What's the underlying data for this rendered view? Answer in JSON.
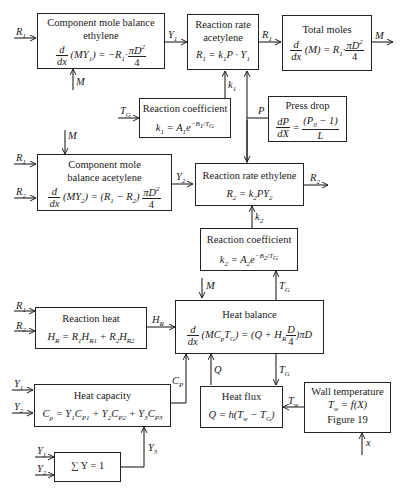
{
  "blocks": {
    "mole_ethylene": {
      "title_1": "Component mole balance",
      "title_2": "ethylene",
      "equation": "d/dx (M Y1) = −R1·πD²/4"
    },
    "rate_acetylene": {
      "title_1": "Reaction rate",
      "title_2": "acetylene",
      "equation": "R1 = k1P · Y1"
    },
    "total_moles": {
      "title": "Total moles",
      "equation": "d/dx (M) = R1·πD²/4"
    },
    "coef1": {
      "title": "Reaction coefficient",
      "equation": "k1 = A1 e^(−B1/TG)"
    },
    "press_drop": {
      "title": "Press drop",
      "equation": "dP/dX = (P0 − 1)/L"
    },
    "mole_acetylene": {
      "title_1": "Component mole",
      "title_2": "balance acetylene",
      "equation": "d/dx (M Y2) = (R1 − R2) πD²/4"
    },
    "rate_ethylene": {
      "title": "Reaction rate ethylene",
      "equation": "R2 = k2PY2"
    },
    "coef2": {
      "title": "Reaction coefficient",
      "equation": "k2 = A2 e^(−B2/TG)"
    },
    "reaction_heat": {
      "title": "Reaction heat",
      "equation": "HR = R1HR1 + R2HR2"
    },
    "heat_balance": {
      "title": "Heat balance",
      "equation": "d/dx (MCpTG) = (Q + HR D/4) πD"
    },
    "heat_capacity": {
      "title": "Heat capacity",
      "equation": "Cp = Y1CP1 + Y2CP2 + Y3CP3"
    },
    "heat_flux": {
      "title": "Heat flux",
      "equation": "Q = h(Tw − TG)"
    },
    "wall_temp": {
      "title": "Wall temperature",
      "equation": "Tw = f(X)",
      "note": "Figure 19"
    },
    "sum_y": {
      "equation": "∑ Y = 1"
    }
  },
  "signals": {
    "R1": "R1",
    "R2": "R2",
    "Y1": "Y1",
    "Y2": "Y2",
    "Y3": "Y3",
    "M": "M",
    "TG": "TG",
    "P": "P",
    "k1": "k1",
    "k2": "k2",
    "HR": "HR",
    "Cp": "Cp",
    "Q": "Q",
    "Tw": "Tw",
    "x": "x"
  }
}
